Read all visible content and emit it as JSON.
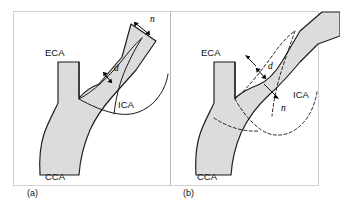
{
  "figure": {
    "background_color": "#ffffff",
    "frame_color": "#cfcfcf",
    "vessel_fill_color": "#dcdcdc",
    "vessel_outline_color": "#1a1a1a",
    "annotation_color": "#000000"
  },
  "panels": [
    {
      "id": "a",
      "marker": "(a)",
      "labels": {
        "eca": "ECA",
        "cca": "CCA",
        "ica": "ICA",
        "residual_diameter": "d",
        "normal_diameter": "n"
      },
      "contour_style": "solid",
      "description": "Distal internal carotid artery used as the normal reference diameter n"
    },
    {
      "id": "b",
      "marker": "(b)",
      "labels": {
        "eca": "ECA",
        "cca": "CCA",
        "ica": "ICA",
        "residual_diameter": "d",
        "normal_diameter": "n"
      },
      "contour_style": "dashed",
      "description": "Estimated original carotid bulb outline used as the normal reference diameter n"
    }
  ],
  "symbols": {
    "d": "d",
    "n": "n"
  }
}
